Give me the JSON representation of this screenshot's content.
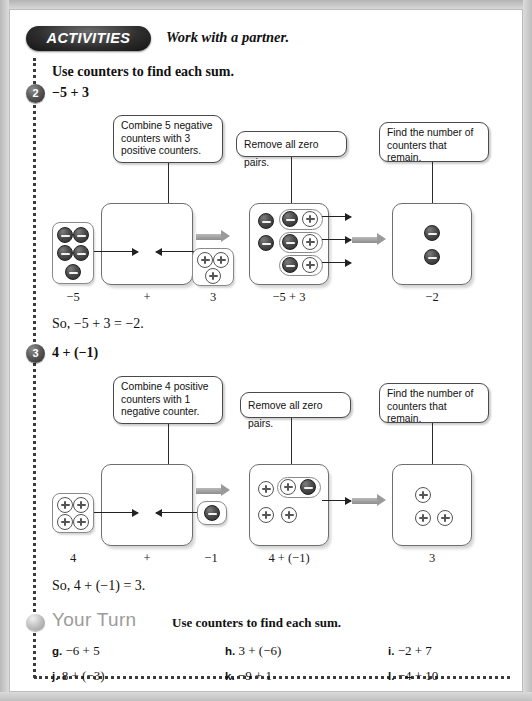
{
  "header": {
    "badge": "ACTIVITIES",
    "subtitle": "Work with a partner."
  },
  "instruction": "Use counters to find each sum.",
  "activities": [
    {
      "number": "2",
      "expression": "−5 + 3",
      "callouts": [
        "Combine 5 negative counters with 3 positive counters.",
        "Remove all zero pairs.",
        "Find the number of counters that remain."
      ],
      "captions": [
        "−5",
        "+",
        "3",
        "−5 + 3",
        "−2"
      ],
      "conclusion": "So, −5 + 3 = −2.",
      "left_tray": {
        "type": "negative",
        "count": 5
      },
      "right_tray": {
        "type": "positive",
        "count": 3
      },
      "zero_pairs": 3,
      "leftover": {
        "type": "negative",
        "count": 2
      },
      "result": {
        "type": "negative",
        "count": 2
      }
    },
    {
      "number": "3",
      "expression": "4 + (−1)",
      "callouts": [
        "Combine 4 positive counters with 1 negative counter.",
        "Remove all zero pairs.",
        "Find the number of counters that remain."
      ],
      "captions": [
        "4",
        "+",
        "−1",
        "4 + (−1)",
        "3"
      ],
      "conclusion": "So, 4 + (−1) = 3.",
      "left_tray": {
        "type": "positive",
        "count": 4
      },
      "right_tray": {
        "type": "negative",
        "count": 1
      },
      "zero_pairs": 1,
      "leftover": {
        "type": "positive",
        "count": 3
      },
      "result": {
        "type": "positive",
        "count": 3
      }
    }
  ],
  "your_turn": {
    "title": "Your Turn",
    "subtitle": "Use counters to find each sum.",
    "exercises": [
      {
        "label": "g.",
        "text": "−6 + 5"
      },
      {
        "label": "h.",
        "text": "3 + (−6)"
      },
      {
        "label": "i.",
        "text": "−2 + 7"
      },
      {
        "label": "j.",
        "text": "8 + (−3)"
      },
      {
        "label": "k.",
        "text": "−9 + 1"
      },
      {
        "label": "l.",
        "text": "−4 + 10"
      }
    ]
  }
}
